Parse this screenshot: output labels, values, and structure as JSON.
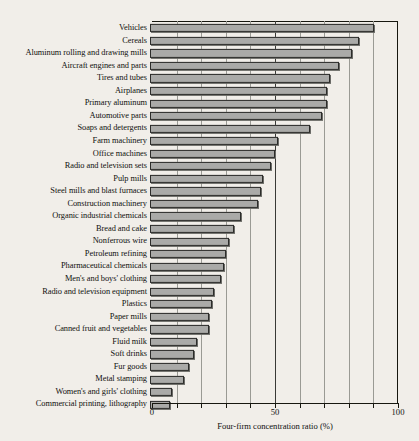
{
  "chart_data": {
    "type": "bar",
    "orientation": "horizontal",
    "title": "",
    "xlabel": "Four-firm concentration ratio (%)",
    "ylabel": "",
    "xlim": [
      0,
      100
    ],
    "xticks": [
      0,
      50,
      100
    ],
    "xtick_labels": [
      "0",
      "50",
      "100"
    ],
    "minor_xticks": [
      10,
      20,
      30,
      40,
      60,
      70,
      80,
      90
    ],
    "grid": true,
    "legend": null,
    "categories": [
      "Vehicles",
      "Cereals",
      "Aluminum rolling and drawing mills",
      "Aircraft engines and parts",
      "Tires and tubes",
      "Airplanes",
      "Primary aluminum",
      "Automotive parts",
      "Soaps and detergents",
      "Farm machinery",
      "Office machines",
      "Radio and television sets",
      "Pulp mills",
      "Steel mills and blast furnaces",
      "Construction machinery",
      "Organic industrial chemicals",
      "Bread and cake",
      "Nonferrous wire",
      "Petroleum refining",
      "Pharmaceutical chemicals",
      "Men's and boys' clothing",
      "Radio and television equipment",
      "Plastics",
      "Paper mills",
      "Canned fruit and vegetables",
      "Fluid milk",
      "Soft drinks",
      "Fur goods",
      "Metal stamping",
      "Women's and girls' clothing",
      "Commercial printing, lithography"
    ],
    "values": [
      91,
      85,
      82,
      77,
      73,
      72,
      72,
      70,
      65,
      52,
      51,
      49,
      46,
      45,
      44,
      37,
      34,
      32,
      31,
      30,
      29,
      26,
      25,
      24,
      24,
      19,
      18,
      16,
      14,
      9,
      8
    ],
    "units": "%"
  },
  "colors": {
    "bar_fill": "#aaaaa8",
    "bar_edge": "#2c2c2a",
    "background": "#f1eee9",
    "axis": "#17170f",
    "grid_minor": "#9a9a94"
  }
}
